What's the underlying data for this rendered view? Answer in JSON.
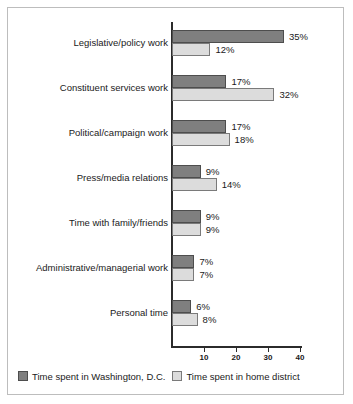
{
  "chart_data": {
    "type": "bar",
    "orientation": "horizontal",
    "title": "",
    "subtitle": "",
    "xlabel": "",
    "ylabel": "",
    "xlim": [
      0,
      42
    ],
    "grid": false,
    "legend_position": "bottom",
    "categories": [
      "Legislative/policy work",
      "Constituent services work",
      "Political/campaign work",
      "Press/media relations",
      "Time with family/friends",
      "Administrative/managerial work",
      "Personal time"
    ],
    "tick_labels": [
      "10",
      "20",
      "30",
      "40"
    ],
    "tick_values": [
      10,
      20,
      30,
      40
    ],
    "series": [
      {
        "name": "Time spent in Washington, D.C.",
        "color": "#7f7f7f",
        "values": [
          35,
          17,
          17,
          9,
          9,
          7,
          6
        ],
        "labels": [
          "35%",
          "17%",
          "17%",
          "9%",
          "9%",
          "7%",
          "6%"
        ]
      },
      {
        "name": "Time spent in home district",
        "color": "#dcdcdc",
        "values": [
          12,
          32,
          18,
          14,
          9,
          7,
          8
        ],
        "labels": [
          "12%",
          "32%",
          "18%",
          "14%",
          "9%",
          "7%",
          "8%"
        ]
      }
    ]
  },
  "legend": {
    "items": [
      {
        "label": "Time spent in Washington, D.C.",
        "swatch": "dc"
      },
      {
        "label": "Time spent in home district",
        "swatch": "home"
      }
    ]
  }
}
